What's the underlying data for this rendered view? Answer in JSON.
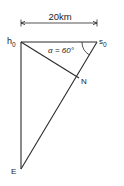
{
  "diagram": {
    "dimension_label": "20km",
    "points": {
      "h0": {
        "label": "h",
        "sub": "0"
      },
      "s0": {
        "label": "s",
        "sub": "0"
      },
      "N": {
        "label": "N"
      },
      "E": {
        "label": "E"
      }
    },
    "angle_label": "α = 60°",
    "segments": [
      "h0-s0",
      "h0-E",
      "h0-N",
      "s0-E"
    ],
    "given": {
      "distance_h0_s0_km": 20,
      "angle_at_s0_deg": 60
    },
    "colors": {
      "ink": "#2a2a2a",
      "background": "#ffffff"
    }
  }
}
